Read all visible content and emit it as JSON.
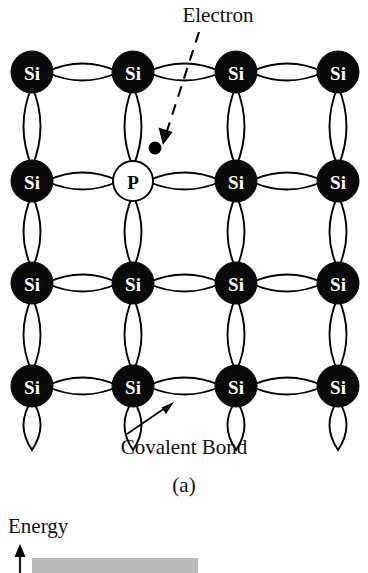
{
  "figure": {
    "panel_label": "(a)",
    "annotations": {
      "electron_label": "Electron",
      "covalent_bond_label": "Covalent Bond",
      "energy_label": "Energy"
    },
    "colors": {
      "si_atom_fill": "#0a0a0a",
      "si_atom_text": "#ffffff",
      "p_atom_fill": "#ffffff",
      "p_atom_text": "#000000",
      "bond_stroke": "#000000",
      "electron_fill": "#000000",
      "energy_band_fill": "#b9b9b9",
      "background": "#ffffff"
    },
    "lattice": {
      "columns_x": [
        32,
        133,
        236,
        338
      ],
      "rows_y": [
        72,
        181,
        283,
        386
      ],
      "atom_radius": 21,
      "rows": [
        {
          "row_index": 0,
          "atoms": [
            {
              "symbol": "Si",
              "type": "silicon",
              "col": 0
            },
            {
              "symbol": "Si",
              "type": "silicon",
              "col": 1
            },
            {
              "symbol": "Si",
              "type": "silicon",
              "col": 2
            },
            {
              "symbol": "Si",
              "type": "silicon",
              "col": 3
            }
          ]
        },
        {
          "row_index": 1,
          "atoms": [
            {
              "symbol": "Si",
              "type": "silicon",
              "col": 0
            },
            {
              "symbol": "P",
              "type": "phosphorus-dopant",
              "col": 1
            },
            {
              "symbol": "Si",
              "type": "silicon",
              "col": 2
            },
            {
              "symbol": "Si",
              "type": "silicon",
              "col": 3
            }
          ]
        },
        {
          "row_index": 2,
          "atoms": [
            {
              "symbol": "Si",
              "type": "silicon",
              "col": 0
            },
            {
              "symbol": "Si",
              "type": "silicon",
              "col": 1
            },
            {
              "symbol": "Si",
              "type": "silicon",
              "col": 2
            },
            {
              "symbol": "Si",
              "type": "silicon",
              "col": 3
            }
          ]
        },
        {
          "row_index": 3,
          "atoms": [
            {
              "symbol": "Si",
              "type": "silicon",
              "col": 0
            },
            {
              "symbol": "Si",
              "type": "silicon",
              "col": 1
            },
            {
              "symbol": "Si",
              "type": "silicon",
              "col": 2
            },
            {
              "symbol": "Si",
              "type": "silicon",
              "col": 3
            }
          ]
        }
      ]
    },
    "free_electron": {
      "cx": 155,
      "cy": 148,
      "r": 6.5
    }
  }
}
